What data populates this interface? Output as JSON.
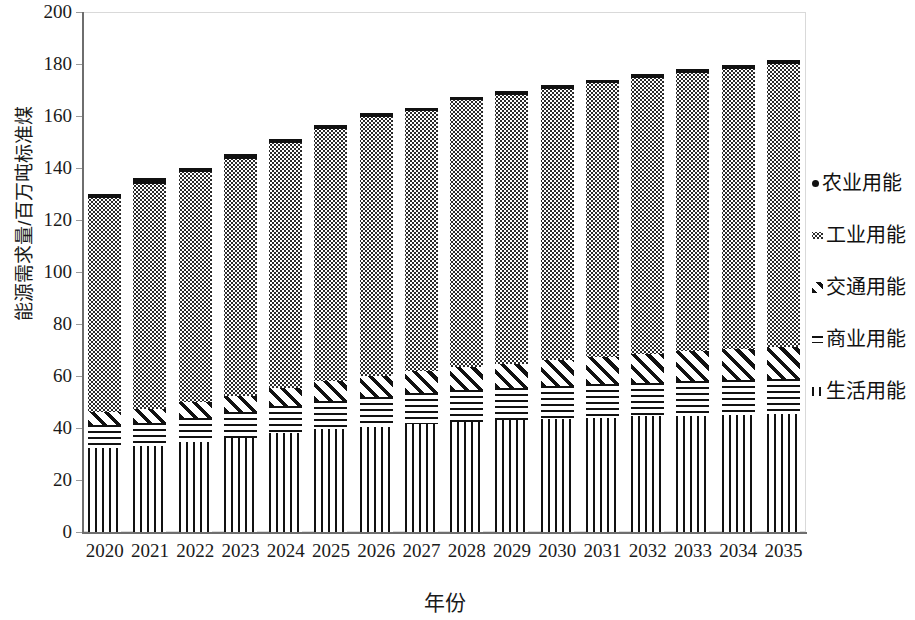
{
  "chart_data": {
    "type": "bar",
    "stacked": true,
    "title": "",
    "xlabel": "年份",
    "ylabel": "能源需求量/百万吨标准煤",
    "ylim": [
      0,
      200
    ],
    "ytick_step": 20,
    "yticks": [
      "0",
      "20",
      "40",
      "60",
      "80",
      "100",
      "120",
      "140",
      "160",
      "180",
      "200"
    ],
    "grid": false,
    "legend_position": "right",
    "categories": [
      "2020",
      "2021",
      "2022",
      "2023",
      "2024",
      "2025",
      "2026",
      "2027",
      "2028",
      "2029",
      "2030",
      "2031",
      "2032",
      "2033",
      "2034",
      "2035"
    ],
    "series": [
      {
        "name": "生活用能",
        "pattern": "vertical-lines",
        "values": [
          32.5,
          33.0,
          34.5,
          36.0,
          38.0,
          39.5,
          40.5,
          41.5,
          42.5,
          43.0,
          43.5,
          44.0,
          44.5,
          44.8,
          45.0,
          45.2
        ]
      },
      {
        "name": "商业用能",
        "pattern": "horizontal-lines",
        "values": [
          8.5,
          9.0,
          9.5,
          10.0,
          10.5,
          11.0,
          11.5,
          11.8,
          12.0,
          12.2,
          12.5,
          12.8,
          13.0,
          13.2,
          13.5,
          13.6
        ]
      },
      {
        "name": "交通用能",
        "pattern": "diagonal-hatch",
        "values": [
          5.0,
          5.5,
          6.0,
          6.5,
          7.0,
          7.5,
          8.0,
          8.5,
          9.0,
          9.5,
          10.0,
          10.5,
          11.0,
          11.5,
          12.0,
          12.2
        ]
      },
      {
        "name": "工业用能",
        "pattern": "dotted",
        "values": [
          82.5,
          86.5,
          88.5,
          91.0,
          94.0,
          97.0,
          99.5,
          100.0,
          102.5,
          103.5,
          104.5,
          105.5,
          106.0,
          107.0,
          107.5,
          109.0
        ]
      },
      {
        "name": "农业用能",
        "pattern": "solid-black",
        "values": [
          1.5,
          2.0,
          1.5,
          2.0,
          1.5,
          1.5,
          1.5,
          1.2,
          1.5,
          1.3,
          1.5,
          1.2,
          1.5,
          1.5,
          1.5,
          1.5
        ]
      }
    ],
    "totals": [
      130.0,
      136.0,
      140.0,
      145.5,
      151.0,
      156.5,
      161.0,
      163.0,
      167.5,
      169.5,
      172.0,
      174.0,
      176.0,
      178.0,
      179.5,
      181.5
    ]
  },
  "legend": {
    "items": [
      {
        "label": "农业用能",
        "pattern": "solid-black"
      },
      {
        "label": "工业用能",
        "pattern": "dotted"
      },
      {
        "label": "交通用能",
        "pattern": "diagonal-hatch"
      },
      {
        "label": "商业用能",
        "pattern": "horizontal-lines"
      },
      {
        "label": "生活用能",
        "pattern": "vertical-lines"
      }
    ]
  },
  "axes": {
    "x_title": "年份",
    "y_title": "能源需求量/百万吨标准煤"
  },
  "top_title": ""
}
